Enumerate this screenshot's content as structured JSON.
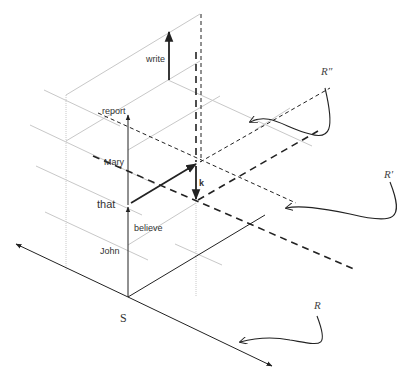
{
  "diagram": {
    "origin_label": "S",
    "words": {
      "write": "write",
      "report": "report",
      "mary": "Mary",
      "that": "that",
      "believe": "believe",
      "john": "John",
      "k": "k"
    },
    "plane_labels": {
      "r": "R",
      "r_prime": "R′",
      "r_double_prime": "R″"
    },
    "colors": {
      "ink": "#222222",
      "grid": "#c8c8c8",
      "text": "#333333"
    }
  }
}
